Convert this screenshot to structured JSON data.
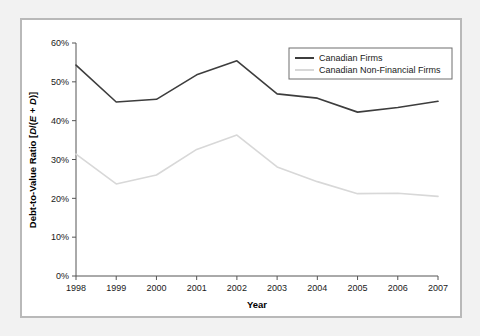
{
  "figure": {
    "panel_background": "#ffffff",
    "page_background": "#f2f2f2",
    "border_color": "#b9b9b9"
  },
  "chart_data": {
    "type": "line",
    "title": "",
    "xlabel": "Year",
    "ylabel": "Debt-to-Value Ratio [D/(E + D)]",
    "ylabel_parts": {
      "prefix": "Debt-to-Value Ratio [",
      "num": "D",
      "slash": "/(",
      "e": "E",
      "plus": " + ",
      "d": "D",
      "suffix": ")]"
    },
    "categories": [
      "1998",
      "1999",
      "2000",
      "2001",
      "2002",
      "2003",
      "2004",
      "2005",
      "2006",
      "2007"
    ],
    "x": [
      1998,
      1999,
      2000,
      2001,
      2002,
      2003,
      2004,
      2005,
      2006,
      2007
    ],
    "ylim": [
      0,
      60
    ],
    "xlim": [
      1998,
      2007
    ],
    "ytick_labels": [
      "0%",
      "10%",
      "20%",
      "30%",
      "40%",
      "50%",
      "60%"
    ],
    "ytick_values": [
      0,
      10,
      20,
      30,
      40,
      50,
      60
    ],
    "grid": false,
    "legend_position": "upper-right",
    "series": [
      {
        "name": "Canadian Firms",
        "color": "#3d3d3d",
        "values": [
          54.3,
          44.8,
          45.5,
          51.8,
          55.4,
          46.9,
          45.8,
          42.2,
          43.4,
          45.0
        ]
      },
      {
        "name": "Canadian Non-Financial Firms",
        "color": "#d8d8d8",
        "values": [
          31.4,
          23.7,
          26.0,
          32.6,
          36.3,
          28.1,
          24.3,
          21.2,
          21.3,
          20.5
        ]
      }
    ]
  }
}
